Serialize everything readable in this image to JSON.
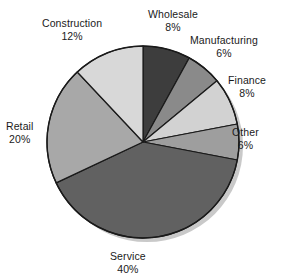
{
  "chart_data": {
    "type": "pie",
    "title": "",
    "subtitle": "",
    "xlabel": "",
    "ylabel": "",
    "legend": "none",
    "grid": false,
    "start_angle_deg": 0,
    "direction": "clockwise",
    "categories": [
      "Wholesale",
      "Manufacturing",
      "Finance",
      "Other",
      "Service",
      "Retail",
      "Construction"
    ],
    "values": [
      8,
      6,
      8,
      6,
      40,
      20,
      12
    ],
    "value_suffix": "%",
    "slices": [
      {
        "label": "Wholesale",
        "value": 8,
        "value_text": "8%",
        "color": "#3d3d3d"
      },
      {
        "label": "Manufacturing",
        "value": 6,
        "value_text": "6%",
        "color": "#8a8a8a"
      },
      {
        "label": "Finance",
        "value": 8,
        "value_text": "8%",
        "color": "#d2d2d2"
      },
      {
        "label": "Other",
        "value": 6,
        "value_text": "6%",
        "color": "#9e9e9e"
      },
      {
        "label": "Service",
        "value": 40,
        "value_text": "40%",
        "color": "#616161"
      },
      {
        "label": "Retail",
        "value": 20,
        "value_text": "20%",
        "color": "#a8a8a8"
      },
      {
        "label": "Construction",
        "value": 12,
        "value_text": "12%",
        "color": "#d8d8d8"
      }
    ],
    "colors": {
      "outline": "#1a1a1a",
      "background": "#ffffff",
      "text": "#1a1a1a",
      "shadow": "#c9c9c9"
    },
    "geometry": {
      "center_x": 143,
      "center_y": 142,
      "radius": 96
    }
  },
  "labels": {
    "wholesale": {
      "name": "Wholesale",
      "value": "8%"
    },
    "manufacturing": {
      "name": "Manufacturing",
      "value": "6%"
    },
    "finance": {
      "name": "Finance",
      "value": "8%"
    },
    "other": {
      "name": "Other",
      "value": "6%"
    },
    "service": {
      "name": "Service",
      "value": "40%"
    },
    "retail": {
      "name": "Retail",
      "value": "20%"
    },
    "construction": {
      "name": "Construction",
      "value": "12%"
    }
  }
}
